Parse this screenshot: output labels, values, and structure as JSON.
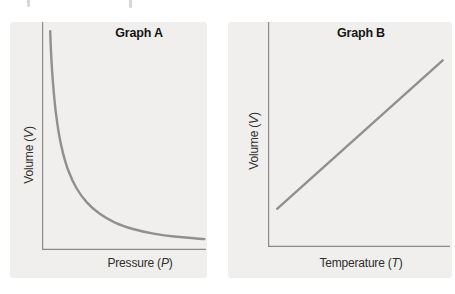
{
  "figure": {
    "description_note": "Side-by-side qualitative gas-law graphs on light gray panels",
    "top_edge_artifact": "illegible cropped text descenders along top edge"
  },
  "colors": {
    "page_bg": "#ffffff",
    "panel_bg": "#f0efed",
    "axis": "#8a8a8a",
    "curve": "#909090",
    "title_text": "#161616",
    "label_text": "#2e2e2e"
  },
  "panels": [
    {
      "title": "Graph A",
      "y_label_prefix": "Volume (",
      "y_label_symbol": "V",
      "y_label_suffix": ")",
      "x_label_prefix": "Pressure (",
      "x_label_symbol": "P",
      "x_label_suffix": ")"
    },
    {
      "title": "Graph B",
      "y_label_prefix": "Volume (",
      "y_label_symbol": "V",
      "y_label_suffix": ")",
      "x_label_prefix": "Temperature (",
      "x_label_symbol": "T",
      "x_label_suffix": ")"
    }
  ],
  "chart_data": [
    {
      "type": "line",
      "title": "Graph A",
      "xlabel": "Pressure (P)",
      "ylabel": "Volume (V)",
      "axes": "unlabeled qualitative axes, no ticks, no gridlines, no legend",
      "relationship": "inverse hyperbolic decay: V decreases sharply then levels off as P increases (Boyle's law shape)",
      "points_normalized": [
        [
          0.05,
          0.96
        ],
        [
          0.055,
          0.87
        ],
        [
          0.062,
          0.78
        ],
        [
          0.072,
          0.69
        ],
        [
          0.085,
          0.6
        ],
        [
          0.103,
          0.51
        ],
        [
          0.128,
          0.425
        ],
        [
          0.162,
          0.345
        ],
        [
          0.21,
          0.272
        ],
        [
          0.272,
          0.21
        ],
        [
          0.35,
          0.16
        ],
        [
          0.445,
          0.12
        ],
        [
          0.555,
          0.092
        ],
        [
          0.68,
          0.072
        ],
        [
          0.82,
          0.058
        ],
        [
          0.99,
          0.048
        ]
      ]
    },
    {
      "type": "line",
      "title": "Graph B",
      "xlabel": "Temperature (T)",
      "ylabel": "Volume (V)",
      "axes": "unlabeled qualitative axes, no ticks, no gridlines, no legend",
      "relationship": "direct linear increase: V rises proportionally with T (Charles's law shape)",
      "points_normalized": [
        [
          0.05,
          0.17
        ],
        [
          0.96,
          0.83
        ]
      ]
    }
  ]
}
